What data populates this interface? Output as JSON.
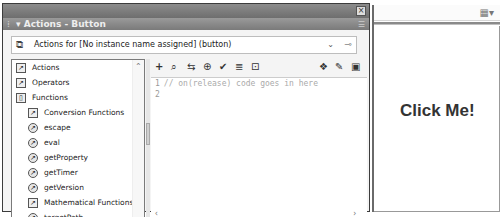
{
  "panel": {
    "title": "Actions - Button",
    "target_label": "Actions for [No instance name assigned] (button)"
  },
  "toolbox": {
    "items": [
      {
        "label": "Actions",
        "icon": "book-icon",
        "level": 0
      },
      {
        "label": "Operators",
        "icon": "book-icon",
        "level": 0
      },
      {
        "label": "Functions",
        "icon": "book-open-icon",
        "level": 0
      },
      {
        "label": "Conversion Functions",
        "icon": "book-icon",
        "level": 1
      },
      {
        "label": "escape",
        "icon": "function-icon",
        "level": 1
      },
      {
        "label": "eval",
        "icon": "function-icon",
        "level": 1
      },
      {
        "label": "getProperty",
        "icon": "function-icon",
        "level": 1
      },
      {
        "label": "getTimer",
        "icon": "function-icon",
        "level": 1
      },
      {
        "label": "getVersion",
        "icon": "function-icon",
        "level": 1
      },
      {
        "label": "Mathematical Functions",
        "icon": "book-icon",
        "level": 1
      },
      {
        "label": "targetPath",
        "icon": "function-icon",
        "level": 1
      },
      {
        "label": "unescape",
        "icon": "function-icon",
        "level": 1
      }
    ]
  },
  "script_toolbar": {
    "add": "+",
    "find": "⌕",
    "replace": "⇆",
    "target": "⊕",
    "check": "✔",
    "format": "≣",
    "hints": "⊡",
    "debug": "❖",
    "reference": "✎",
    "menu": "▣"
  },
  "editor": {
    "lines": [
      {
        "num": "1",
        "text": "// on(release) code goes in here"
      },
      {
        "num": "2",
        "text": ""
      }
    ],
    "status": "Line 2 of 2, Col 1"
  },
  "stage": {
    "button_text": "Click Me!"
  }
}
